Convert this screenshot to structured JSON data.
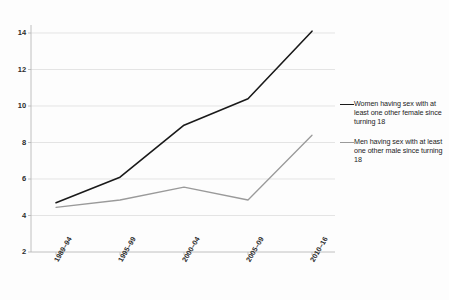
{
  "chart_data": {
    "type": "line",
    "title": "",
    "subtitle": "",
    "xlabel": "",
    "ylabel": "",
    "categories": [
      "1989–94",
      "1995–99",
      "2000–04",
      "2005–09",
      "2010–16"
    ],
    "ylim": [
      2,
      14
    ],
    "yticks": [
      2,
      4,
      6,
      8,
      10,
      12,
      14
    ],
    "ytick_labels": [
      "2",
      "4",
      "6",
      "8",
      "10",
      "12",
      "14"
    ],
    "grid": true,
    "grid_axis": "y",
    "legend_position": "right",
    "series": [
      {
        "name": "Women having sex with at least one other female since turning 18",
        "color": "#1a1a1a",
        "width": 1.6,
        "values": [
          4.7,
          6.1,
          8.95,
          10.4,
          14.1
        ]
      },
      {
        "name": "Men having sex with at least one other male since turning 18",
        "color": "#9a9a9a",
        "width": 1.3,
        "values": [
          4.45,
          4.85,
          5.55,
          4.85,
          8.4
        ]
      }
    ]
  },
  "axis": {
    "line_color": "#b9b9b9",
    "grid_color": "#d8d8d8"
  },
  "legend": {
    "entries": [
      {
        "label": "Women having sex with at least one other female since turning 18",
        "swatch_name": "legend-swatch-women",
        "color": "#1a1a1a"
      },
      {
        "label": "Men having sex with at least one other male since turning 18",
        "swatch_name": "legend-swatch-men",
        "color": "#9a9a9a"
      }
    ]
  }
}
